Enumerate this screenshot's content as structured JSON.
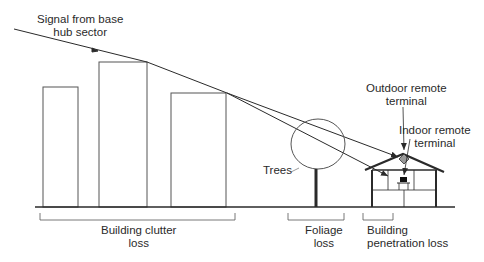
{
  "labels": {
    "signal": "Signal from base\nhub sector",
    "outdoor_terminal": "Outdoor remote\nterminal",
    "indoor_terminal": "Indoor remote\nterminal",
    "trees": "Trees",
    "building_clutter_loss": "Building clutter\nloss",
    "foliage_loss": "Foliage\nloss",
    "building_penetration_loss": "Building\npenetration loss"
  },
  "colors": {
    "line": "#2a2a2a",
    "thin_line": "#555555",
    "terminal_fill": "#999999"
  }
}
